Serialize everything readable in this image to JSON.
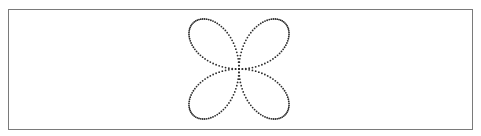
{
  "figure": {
    "frame": {
      "x": 8,
      "y": 9,
      "width": 465,
      "height": 121,
      "border_color": "#7a7a7a"
    },
    "curve": {
      "name": "four-petal rose (quadrifolium)",
      "equation": "r = sin(2θ)",
      "center": [
        239,
        69
      ],
      "scale": 65,
      "samples": 240,
      "dot_radius": 0.9,
      "dot_color": "#2b2b2b",
      "petals": 4,
      "extent": {
        "x": [
          189,
          289
        ],
        "y": [
          20,
          119
        ]
      }
    }
  }
}
